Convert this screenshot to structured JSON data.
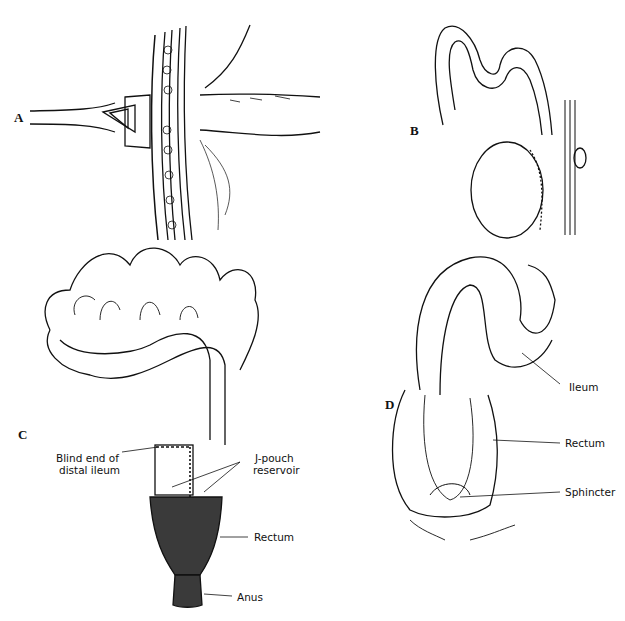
{
  "figure": {
    "panels": [
      {
        "id": "A",
        "letter": "A"
      },
      {
        "id": "B",
        "letter": "B"
      },
      {
        "id": "C",
        "letter": "C",
        "labels": {
          "blind_end_line1": "Blind end of",
          "blind_end_line2": "distal ileum",
          "jpouch_line1": "J-pouch",
          "jpouch_line2": "reservoir",
          "rectum": "Rectum",
          "anus": "Anus"
        }
      },
      {
        "id": "D",
        "letter": "D",
        "labels": {
          "ileum": "Ileum",
          "rectum": "Rectum",
          "sphincter": "Sphincter"
        }
      }
    ],
    "colors": {
      "line": "#111111",
      "rectum_fill": "#3a3a3a",
      "background": "#ffffff"
    }
  }
}
